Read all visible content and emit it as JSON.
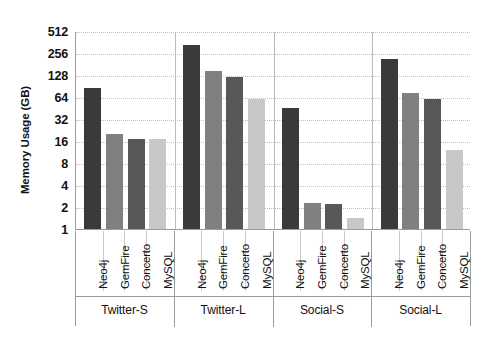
{
  "chart_data": {
    "type": "bar",
    "title": "",
    "xlabel": "",
    "ylabel": "Memory Usage (GB)",
    "yscale": "log2",
    "ylim": [
      1,
      512
    ],
    "yticks": [
      1,
      2,
      4,
      8,
      16,
      32,
      64,
      128,
      256,
      512
    ],
    "ytick_labels": [
      "1",
      "2",
      "4",
      "8",
      "16",
      "32",
      "64",
      "128",
      "256",
      "512"
    ],
    "grid": true,
    "legend": "none",
    "groups": [
      "Twitter-S",
      "Twitter-L",
      "Social-S",
      "Social-L"
    ],
    "categories": [
      "Neo4j",
      "GemFire",
      "Concerto",
      "MySQL"
    ],
    "series": [
      {
        "name": "Neo4j",
        "color": "#3a3a3a",
        "values": [
          84,
          330,
          45,
          210
        ]
      },
      {
        "name": "GemFire",
        "color": "#808080",
        "values": [
          20,
          145,
          2.3,
          72
        ]
      },
      {
        "name": "Concerto",
        "color": "#585858",
        "values": [
          17,
          120,
          2.2,
          61
        ]
      },
      {
        "name": "MySQL",
        "color": "#c8c8c8",
        "values": [
          17,
          60,
          1.4,
          12
        ]
      }
    ],
    "bars": [
      {
        "group": "Twitter-S",
        "category": "Neo4j",
        "value": 84,
        "color": "#3a3a3a"
      },
      {
        "group": "Twitter-S",
        "category": "GemFire",
        "value": 20,
        "color": "#808080"
      },
      {
        "group": "Twitter-S",
        "category": "Concerto",
        "value": 17,
        "color": "#585858"
      },
      {
        "group": "Twitter-S",
        "category": "MySQL",
        "value": 17,
        "color": "#c8c8c8"
      },
      {
        "group": "Twitter-L",
        "category": "Neo4j",
        "value": 330,
        "color": "#3a3a3a"
      },
      {
        "group": "Twitter-L",
        "category": "GemFire",
        "value": 145,
        "color": "#808080"
      },
      {
        "group": "Twitter-L",
        "category": "Concerto",
        "value": 120,
        "color": "#585858"
      },
      {
        "group": "Twitter-L",
        "category": "MySQL",
        "value": 60,
        "color": "#c8c8c8"
      },
      {
        "group": "Social-S",
        "category": "Neo4j",
        "value": 45,
        "color": "#3a3a3a"
      },
      {
        "group": "Social-S",
        "category": "GemFire",
        "value": 2.3,
        "color": "#808080"
      },
      {
        "group": "Social-S",
        "category": "Concerto",
        "value": 2.2,
        "color": "#585858"
      },
      {
        "group": "Social-S",
        "category": "MySQL",
        "value": 1.4,
        "color": "#c8c8c8"
      },
      {
        "group": "Social-L",
        "category": "Neo4j",
        "value": 210,
        "color": "#3a3a3a"
      },
      {
        "group": "Social-L",
        "category": "GemFire",
        "value": 72,
        "color": "#808080"
      },
      {
        "group": "Social-L",
        "category": "Concerto",
        "value": 61,
        "color": "#585858"
      },
      {
        "group": "Social-L",
        "category": "MySQL",
        "value": 12,
        "color": "#c8c8c8"
      }
    ]
  }
}
